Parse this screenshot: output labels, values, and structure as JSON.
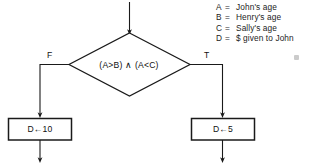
{
  "diagram": {
    "entry_arrow": {
      "name": "entry-arrow"
    },
    "decision": {
      "condition": "(A>B) ∧ (A<C)",
      "false_label": "F",
      "true_label": "T"
    },
    "process_false": {
      "text": "D←10"
    },
    "process_true": {
      "text": "D←5"
    },
    "legend": [
      {
        "var": "A",
        "eq": "=",
        "meaning": "John's age"
      },
      {
        "var": "B",
        "eq": "=",
        "meaning": "Henry's age"
      },
      {
        "var": "C",
        "eq": "=",
        "meaning": "Sally's age"
      },
      {
        "var": "D",
        "eq": "=",
        "meaning": "$ given to John"
      }
    ],
    "colors": {
      "stroke": "#1a1a1a",
      "text": "#111111",
      "background": "#ffffff",
      "speck": "#b9b9b9"
    }
  }
}
